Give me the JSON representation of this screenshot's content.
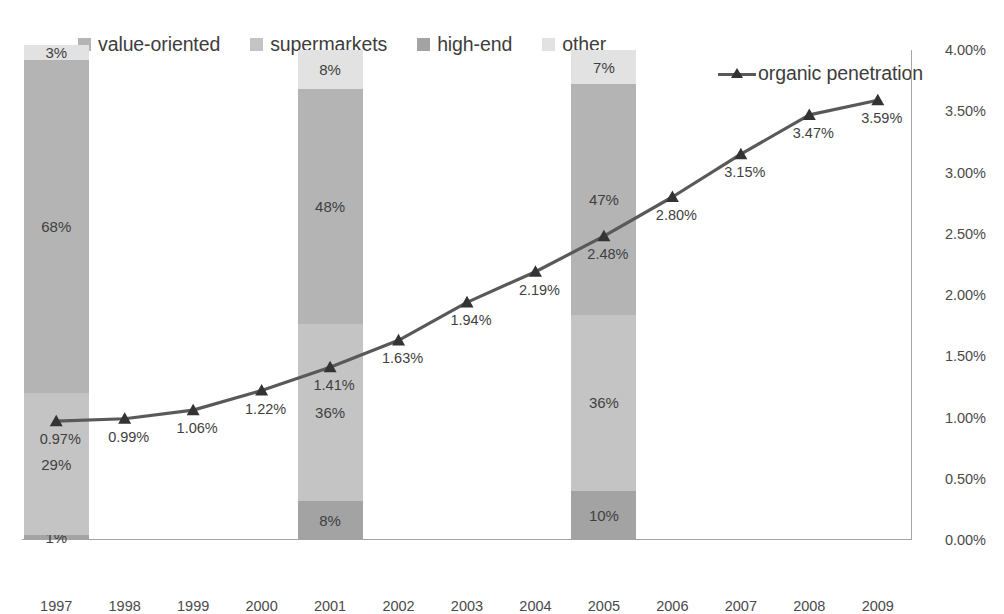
{
  "legend": {
    "items": [
      {
        "label": "value-oriented",
        "color": "#b4b4b4"
      },
      {
        "label": "supermarkets",
        "color": "#c4c4c4"
      },
      {
        "label": "high-end",
        "color": "#a3a3a3"
      },
      {
        "label": "other",
        "color": "#e2e2e2"
      }
    ],
    "line_series": {
      "label": "organic penetration",
      "color": "#595959",
      "marker": "triangle-marker"
    }
  },
  "chart_data": {
    "type": "bar",
    "title": "",
    "xlabel": "",
    "ylabel": "",
    "grid": false,
    "legend_position": "top",
    "categories": [
      "1997",
      "1998",
      "1999",
      "2000",
      "2001",
      "2002",
      "2003",
      "2004",
      "2005",
      "2006",
      "2007",
      "2008",
      "2009"
    ],
    "y_axis": {
      "side": "right",
      "ticks": [
        "0.00%",
        "0.50%",
        "1.00%",
        "1.50%",
        "2.00%",
        "2.50%",
        "3.00%",
        "3.50%",
        "4.00%"
      ],
      "tick_values": [
        0,
        0.5,
        1.0,
        1.5,
        2.0,
        2.5,
        3.0,
        3.5,
        4.0
      ],
      "ylim": [
        0,
        4.0
      ]
    },
    "stacked_bars": {
      "stack_order_bottom_to_top": [
        "high-end",
        "supermarkets",
        "value-oriented",
        "other"
      ],
      "years": [
        "1997",
        "2001",
        "2005"
      ],
      "series": [
        {
          "name": "high-end",
          "color": "#a3a3a3",
          "values": [
            1,
            8,
            10
          ],
          "labels": [
            "1%",
            "8%",
            "10%"
          ]
        },
        {
          "name": "supermarkets",
          "color": "#c4c4c4",
          "values": [
            29,
            36,
            36
          ],
          "labels": [
            "29%",
            "36%",
            "36%"
          ]
        },
        {
          "name": "value-oriented",
          "color": "#b4b4b4",
          "values": [
            68,
            48,
            47
          ],
          "labels": [
            "68%",
            "48%",
            "47%"
          ]
        },
        {
          "name": "other",
          "color": "#e2e2e2",
          "values": [
            3,
            8,
            7
          ],
          "labels": [
            "3%",
            "8%",
            "7%"
          ]
        }
      ]
    },
    "line_series": {
      "name": "organic penetration",
      "color": "#595959",
      "x": [
        "1997",
        "1998",
        "1999",
        "2000",
        "2001",
        "2002",
        "2003",
        "2004",
        "2005",
        "2006",
        "2007",
        "2008",
        "2009"
      ],
      "values": [
        0.97,
        0.99,
        1.06,
        1.22,
        1.41,
        1.63,
        1.94,
        2.19,
        2.48,
        2.8,
        3.15,
        3.47,
        3.59
      ],
      "labels": [
        "0.97%",
        "0.99%",
        "1.06%",
        "1.22%",
        "1.41%",
        "1.63%",
        "1.94%",
        "2.19%",
        "2.48%",
        "2.80%",
        "3.15%",
        "3.47%",
        "3.59%"
      ]
    }
  }
}
